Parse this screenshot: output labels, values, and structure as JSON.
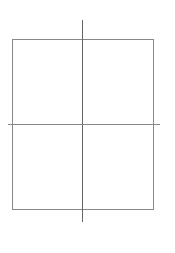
{
  "canvas": {
    "width": 175,
    "height": 253,
    "background": "#ffffff"
  },
  "diagram": {
    "stroke_color": "#888888",
    "rectangle": {
      "x": 12,
      "y": 39,
      "width": 141,
      "height": 170
    },
    "vertical_line": {
      "x": 82,
      "y1": 20,
      "y2": 222
    },
    "horizontal_line": {
      "y": 124,
      "x1": 8,
      "x2": 160
    }
  }
}
